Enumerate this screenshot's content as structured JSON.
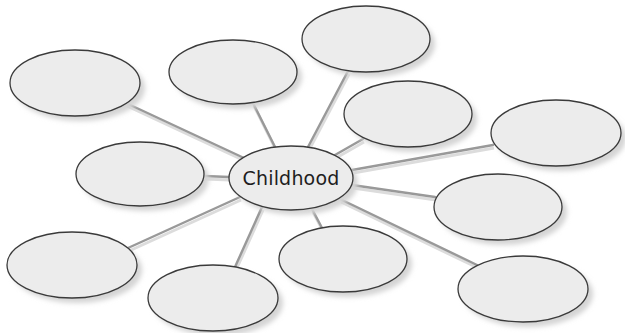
{
  "diagram": {
    "type": "mind-map / web organizer",
    "center": {
      "label": "Childhood",
      "cx": 291,
      "cy": 178,
      "rx": 62,
      "ry": 32
    },
    "nodes": [
      {
        "id": "node-1",
        "label": "",
        "cx": 75,
        "cy": 83,
        "rx": 65,
        "ry": 33
      },
      {
        "id": "node-2",
        "label": "",
        "cx": 233,
        "cy": 72,
        "rx": 64,
        "ry": 32
      },
      {
        "id": "node-3",
        "label": "",
        "cx": 366,
        "cy": 39,
        "rx": 64,
        "ry": 33
      },
      {
        "id": "node-4",
        "label": "",
        "cx": 408,
        "cy": 114,
        "rx": 64,
        "ry": 33
      },
      {
        "id": "node-5",
        "label": "",
        "cx": 556,
        "cy": 133,
        "rx": 65,
        "ry": 33
      },
      {
        "id": "node-6",
        "label": "",
        "cx": 498,
        "cy": 207,
        "rx": 64,
        "ry": 33
      },
      {
        "id": "node-7",
        "label": "",
        "cx": 523,
        "cy": 289,
        "rx": 65,
        "ry": 33
      },
      {
        "id": "node-8",
        "label": "",
        "cx": 343,
        "cy": 259,
        "rx": 64,
        "ry": 33
      },
      {
        "id": "node-9",
        "label": "",
        "cx": 213,
        "cy": 298,
        "rx": 65,
        "ry": 33
      },
      {
        "id": "node-10",
        "label": "",
        "cx": 72,
        "cy": 265,
        "rx": 65,
        "ry": 33
      },
      {
        "id": "node-11",
        "label": "",
        "cx": 140,
        "cy": 174,
        "rx": 64,
        "ry": 32
      }
    ],
    "connectors": [
      {
        "from": "center",
        "to": "node-1",
        "x1": 244,
        "y1": 158,
        "x2": 126,
        "y2": 103
      },
      {
        "from": "center",
        "to": "node-2",
        "x1": 275,
        "y1": 147,
        "x2": 253,
        "y2": 103
      },
      {
        "from": "center",
        "to": "node-3",
        "x1": 308,
        "y1": 147,
        "x2": 348,
        "y2": 71
      },
      {
        "from": "center",
        "to": "node-4",
        "x1": 335,
        "y1": 155,
        "x2": 363,
        "y2": 139
      },
      {
        "from": "center",
        "to": "node-5",
        "x1": 352,
        "y1": 170,
        "x2": 493,
        "y2": 145
      },
      {
        "from": "center",
        "to": "node-6",
        "x1": 352,
        "y1": 185,
        "x2": 435,
        "y2": 197
      },
      {
        "from": "center",
        "to": "node-7",
        "x1": 340,
        "y1": 199,
        "x2": 477,
        "y2": 265
      },
      {
        "from": "center",
        "to": "node-8",
        "x1": 312,
        "y1": 209,
        "x2": 322,
        "y2": 228
      },
      {
        "from": "center",
        "to": "node-9",
        "x1": 262,
        "y1": 207,
        "x2": 235,
        "y2": 267
      },
      {
        "from": "center",
        "to": "node-10",
        "x1": 240,
        "y1": 197,
        "x2": 128,
        "y2": 248
      },
      {
        "from": "center",
        "to": "node-11",
        "x1": 229,
        "y1": 177,
        "x2": 204,
        "y2": 176
      }
    ],
    "colors": {
      "background": "#ffffff",
      "ellipse_fill": "#ececec",
      "ellipse_stroke": "#3a3a3a",
      "shadow": "#d4d4d4",
      "connector": "#999999",
      "connector_shadow": "#dcdcdc",
      "text": "#1e1e1e"
    }
  }
}
